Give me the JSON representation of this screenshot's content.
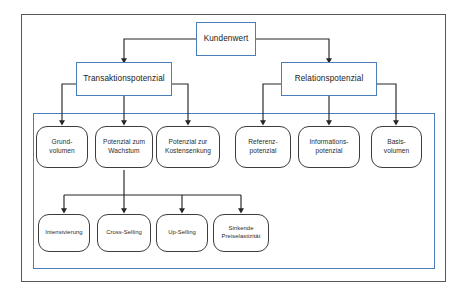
{
  "diagram": {
    "colors": {
      "box_border_blue": "#4a7ebb",
      "box_border_dark": "#3d3d3d",
      "outer_frame": "#595959",
      "inner_frame": "#4a7ebb",
      "connector": "#262626",
      "background": "#ffffff"
    },
    "levels": {
      "root": {
        "label": "Kundenwert"
      },
      "second": [
        {
          "id": "transaktionspotenzial",
          "label": "Transaktionspotenzial"
        },
        {
          "id": "relationspotenzial",
          "label": "Relationspotenzial"
        }
      ],
      "third": [
        {
          "id": "grundvolumen",
          "label": "Grund-\nvolumen",
          "parent": "transaktionspotenzial"
        },
        {
          "id": "potenzial-wachstum",
          "label": "Potenzial zum\nWachstum",
          "parent": "transaktionspotenzial"
        },
        {
          "id": "potenzial-kostensenkung",
          "label": "Potenzial zur\nKostensenkung",
          "parent": "transaktionspotenzial"
        },
        {
          "id": "referenzpotenzial",
          "label": "Referenz-\npotenzial",
          "parent": "relationspotenzial"
        },
        {
          "id": "informationspotenzial",
          "label": "Informations-\npotenzial",
          "parent": "relationspotenzial"
        },
        {
          "id": "basisvolumen",
          "label": "Basis-\nvolumen",
          "parent": "relationspotenzial"
        }
      ],
      "fourth": [
        {
          "id": "intensivierung",
          "label": "Intensivierung",
          "parent": "potenzial-wachstum"
        },
        {
          "id": "cross-selling",
          "label": "Cross-Selling",
          "parent": "potenzial-wachstum"
        },
        {
          "id": "up-selling",
          "label": "Up-Selling",
          "parent": "potenzial-wachstum"
        },
        {
          "id": "sinkende-preiselastizitaet",
          "label": "Sinkende\nPreiselastizität",
          "parent": "potenzial-wachstum"
        }
      ]
    }
  }
}
